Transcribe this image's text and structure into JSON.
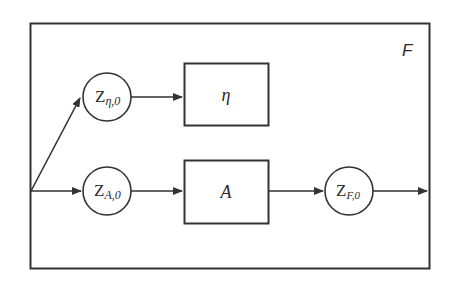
{
  "diagram": {
    "frame_label": "F",
    "colors": {
      "stroke": "#333333",
      "background": "#ffffff"
    },
    "nodes": {
      "z_eta": {
        "main": "Z",
        "sub": "η,0"
      },
      "z_a": {
        "main": "Z",
        "sub": "A,0"
      },
      "z_f": {
        "main": "Z",
        "sub": "F,0"
      },
      "block_eta": {
        "label": "η"
      },
      "block_a": {
        "label": "A"
      }
    },
    "edges": [
      {
        "from": "input-split",
        "to": "z_eta"
      },
      {
        "from": "input-split",
        "to": "z_a"
      },
      {
        "from": "z_eta",
        "to": "block_eta"
      },
      {
        "from": "z_a",
        "to": "block_a"
      },
      {
        "from": "block_a",
        "to": "z_f"
      },
      {
        "from": "z_f",
        "to": "output"
      }
    ]
  }
}
